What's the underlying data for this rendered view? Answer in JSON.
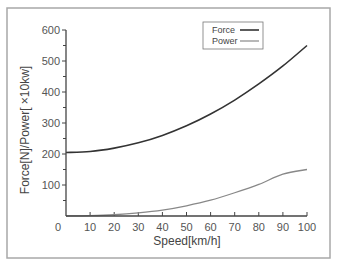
{
  "chart_data": {
    "type": "line",
    "title": "",
    "xlabel": "Speed[km/h]",
    "ylabel": "Force[N]/Power[ ×10kw]",
    "xlim": [
      0,
      100
    ],
    "ylim": [
      0,
      600
    ],
    "x_ticks": [
      10,
      20,
      30,
      40,
      50,
      60,
      70,
      80,
      90,
      100
    ],
    "x_origin_label": "0",
    "y_ticks_labeled": [
      100,
      200,
      300,
      400,
      500,
      600
    ],
    "y_ticks_minor": [
      50,
      150,
      250,
      350,
      450,
      550
    ],
    "grid": false,
    "legend_position": "upper right",
    "x": [
      0,
      10,
      20,
      30,
      40,
      50,
      60,
      70,
      80,
      90,
      100
    ],
    "series": [
      {
        "name": "Force",
        "color": "#333333",
        "values": [
          205,
          208,
          219,
          236,
          260,
          291,
          329,
          374,
          426,
          484,
          550
        ]
      },
      {
        "name": "Power",
        "color": "#888888",
        "values": [
          0,
          1,
          4,
          10,
          19,
          33,
          51,
          75,
          102,
          135,
          150
        ]
      }
    ]
  },
  "legend": {
    "items": [
      {
        "label": "Force",
        "color": "#333333"
      },
      {
        "label": "Power",
        "color": "#888888"
      }
    ]
  }
}
